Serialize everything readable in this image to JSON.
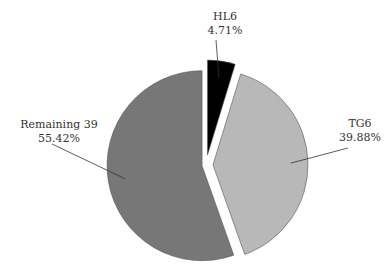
{
  "chart_data": {
    "type": "pie",
    "title": "",
    "exploded": true,
    "start_angle_deg": 0,
    "direction": "clockwise",
    "slices": [
      {
        "label": "HL6",
        "value": 4.71,
        "value_text": "4.71%",
        "color": "#000000"
      },
      {
        "label": "TG6",
        "value": 39.88,
        "value_text": "39.88%",
        "color": "#b8b8b8"
      },
      {
        "label": "Remaining 39",
        "value": 55.42,
        "value_text": "55.42%",
        "color": "#777777"
      }
    ],
    "legend": "none",
    "label_style": "outside with leader lines"
  }
}
